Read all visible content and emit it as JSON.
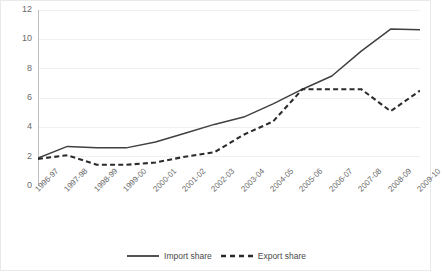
{
  "chart_data": {
    "type": "line",
    "title": "",
    "subtitle": "",
    "xlabel": "",
    "ylabel": "",
    "ylim": [
      0,
      12
    ],
    "yticks": [
      0,
      2,
      4,
      6,
      8,
      10,
      12
    ],
    "grid": true,
    "legend_position": "bottom",
    "categories": [
      "1996-97",
      "1997-98",
      "1998-99",
      "1999-00",
      "2000-01",
      "2001-02",
      "2002-03",
      "2003-04",
      "2004-05",
      "2005-06",
      "2006-07",
      "2007-08",
      "2008-09",
      "2009-10"
    ],
    "series": [
      {
        "name": "Import share",
        "style": "solid",
        "color": "#404040",
        "values": [
          1.9,
          2.7,
          2.6,
          2.6,
          3.0,
          3.6,
          4.2,
          4.7,
          5.6,
          6.6,
          7.5,
          9.2,
          10.7,
          10.65
        ]
      },
      {
        "name": "Export share",
        "style": "dashed",
        "color": "#2b2b2b",
        "values": [
          1.85,
          2.1,
          1.45,
          1.45,
          1.6,
          2.0,
          2.3,
          3.5,
          4.4,
          6.6,
          6.6,
          6.6,
          5.1,
          6.5
        ]
      }
    ]
  },
  "legend": {
    "items": [
      {
        "label": "Import share",
        "style": "solid",
        "color": "#404040"
      },
      {
        "label": "Export share",
        "style": "dashed",
        "color": "#2b2b2b"
      }
    ]
  },
  "axes": {
    "y_tick_labels": [
      "12",
      "10",
      "8",
      "6",
      "4",
      "2",
      "0"
    ],
    "x_tick_labels": [
      "1996-97",
      "1997-98",
      "1998-99",
      "1999-00",
      "2000-01",
      "2001-02",
      "2002-03",
      "2003-04",
      "2004-05",
      "2005-06",
      "2006-07",
      "2007-08",
      "2008-09",
      "2009-10"
    ]
  }
}
